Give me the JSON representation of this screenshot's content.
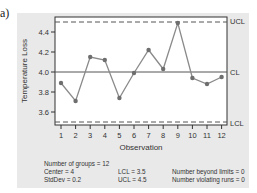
{
  "figure_label": "a)",
  "chart_data": {
    "type": "line",
    "title": "",
    "xlabel": "Observation",
    "ylabel": "Temperature Loss",
    "x": [
      1,
      2,
      3,
      4,
      5,
      6,
      7,
      8,
      9,
      10,
      11,
      12
    ],
    "series": [
      {
        "name": "Temperature Loss",
        "values": [
          3.89,
          3.71,
          4.15,
          4.12,
          3.74,
          3.99,
          4.22,
          4.03,
          4.49,
          3.94,
          3.88,
          3.95
        ]
      }
    ],
    "control_lines": {
      "UCL": 4.5,
      "CL": 4.0,
      "LCL": 3.5
    },
    "y_ticks": [
      "3.6",
      "3.8",
      "4.0",
      "4.2",
      "4.4"
    ],
    "x_ticks": [
      "1",
      "2",
      "3",
      "4",
      "5",
      "6",
      "7",
      "8",
      "9",
      "10",
      "11",
      "12"
    ],
    "ylim": [
      3.47,
      4.55
    ],
    "xlim": [
      0.6,
      12.4
    ],
    "grid": false,
    "legend": null
  },
  "labels": {
    "ucl": "UCL",
    "cl": "CL",
    "lcl": "LCL"
  },
  "stats": {
    "groups": "Number of groups = 12",
    "center": "Center = 4",
    "stddev": "StdDev = 0.2",
    "lcl": "LCL = 3.5",
    "ucl": "UCL = 4.5",
    "beyond": "Number beyond limits = 0",
    "violating": "Number violating runs = 0"
  },
  "colors": {
    "line": "#8a8a8a",
    "point": "#6e6e6e",
    "frame": "#333333",
    "panel": "#e9e9e9"
  }
}
